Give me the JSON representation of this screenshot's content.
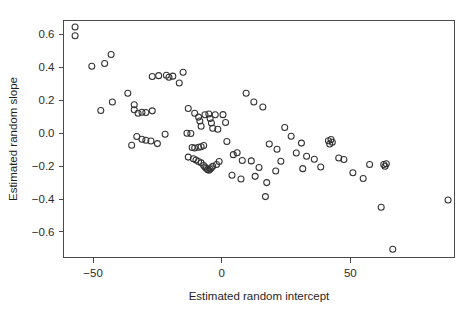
{
  "figure": {
    "width": 475,
    "height": 310,
    "background": "#ffffff",
    "point_color": "#333333",
    "axis_color": "#4a4a4a"
  },
  "chart_data": {
    "type": "scatter",
    "title": "",
    "xlabel": "Estimated random intercept",
    "ylabel": "Estimated random slope",
    "xlim": [
      -61.5,
      90.5
    ],
    "ylim": [
      -0.755,
      0.685
    ],
    "xticks": [
      -50,
      0,
      50
    ],
    "xticklabels": [
      "−50",
      "0",
      "50"
    ],
    "yticks": [
      -0.6,
      -0.4,
      -0.2,
      0.0,
      0.2,
      0.4,
      0.6
    ],
    "yticklabels": [
      "−0.6",
      "−0.4",
      "−0.2",
      "0.0",
      "0.2",
      "0.4",
      "0.6"
    ],
    "grid": false,
    "legend": null,
    "marker": "open-circle",
    "marker_size": 3.0,
    "n_points": 104,
    "points": [
      [
        -57.0,
        0.645
      ],
      [
        -57.0,
        0.592
      ],
      [
        -50.5,
        0.407
      ],
      [
        -45.5,
        0.424
      ],
      [
        -43.0,
        0.478
      ],
      [
        -47.0,
        0.138
      ],
      [
        -42.5,
        0.19
      ],
      [
        -36.5,
        0.243
      ],
      [
        -34.0,
        0.173
      ],
      [
        -34.0,
        0.143
      ],
      [
        -32.5,
        0.122
      ],
      [
        -31.0,
        0.127
      ],
      [
        -29.5,
        0.126
      ],
      [
        -27.0,
        0.136
      ],
      [
        -27.0,
        0.345
      ],
      [
        -24.5,
        0.35
      ],
      [
        -21.5,
        0.352
      ],
      [
        -20.5,
        0.34
      ],
      [
        -19.0,
        0.347
      ],
      [
        -15.0,
        0.37
      ],
      [
        -16.5,
        0.305
      ],
      [
        -35.0,
        -0.073
      ],
      [
        -33.0,
        -0.02
      ],
      [
        -31.0,
        -0.037
      ],
      [
        -29.5,
        -0.043
      ],
      [
        -27.5,
        -0.047
      ],
      [
        -25.0,
        -0.063
      ],
      [
        -22.0,
        -0.006
      ],
      [
        -13.0,
        0.15
      ],
      [
        -10.5,
        0.122
      ],
      [
        -9.0,
        0.098
      ],
      [
        -8.5,
        0.075
      ],
      [
        -8.0,
        0.042
      ],
      [
        -6.5,
        0.112
      ],
      [
        -5.0,
        0.117
      ],
      [
        -4.5,
        0.09
      ],
      [
        -4.0,
        0.062
      ],
      [
        -3.5,
        0.03
      ],
      [
        -2.5,
        0.112
      ],
      [
        -1.5,
        0.024
      ],
      [
        -13.5,
        0.0
      ],
      [
        -12.0,
        -0.002
      ],
      [
        -11.5,
        -0.087
      ],
      [
        -10.5,
        -0.09
      ],
      [
        -9.0,
        -0.085
      ],
      [
        -8.0,
        -0.082
      ],
      [
        -7.0,
        -0.075
      ],
      [
        -13.0,
        -0.145
      ],
      [
        -11.0,
        -0.155
      ],
      [
        -10.0,
        -0.162
      ],
      [
        -9.0,
        -0.172
      ],
      [
        -8.0,
        -0.18
      ],
      [
        -7.0,
        -0.196
      ],
      [
        -6.5,
        -0.205
      ],
      [
        -6.0,
        -0.213
      ],
      [
        -5.5,
        -0.22
      ],
      [
        -5.0,
        -0.225
      ],
      [
        -4.5,
        -0.218
      ],
      [
        -4.0,
        -0.21
      ],
      [
        -3.5,
        -0.2
      ],
      [
        -2.0,
        -0.19
      ],
      [
        -1.0,
        -0.172
      ],
      [
        0.5,
        0.113
      ],
      [
        1.5,
        0.065
      ],
      [
        2.0,
        -0.05
      ],
      [
        4.5,
        -0.13
      ],
      [
        6.0,
        -0.118
      ],
      [
        8.0,
        -0.165
      ],
      [
        4.0,
        -0.255
      ],
      [
        7.5,
        -0.278
      ],
      [
        11.5,
        -0.168
      ],
      [
        13.0,
        -0.262
      ],
      [
        14.5,
        -0.208
      ],
      [
        17.5,
        -0.3
      ],
      [
        9.5,
        0.243
      ],
      [
        12.5,
        0.19
      ],
      [
        16.0,
        0.16
      ],
      [
        18.5,
        -0.065
      ],
      [
        21.5,
        -0.097
      ],
      [
        23.0,
        -0.17
      ],
      [
        21.0,
        -0.23
      ],
      [
        17.0,
        -0.385
      ],
      [
        24.5,
        0.035
      ],
      [
        27.0,
        -0.018
      ],
      [
        29.0,
        -0.12
      ],
      [
        31.0,
        -0.06
      ],
      [
        33.0,
        -0.14
      ],
      [
        31.5,
        -0.215
      ],
      [
        36.0,
        -0.158
      ],
      [
        38.5,
        -0.205
      ],
      [
        41.5,
        -0.046
      ],
      [
        42.5,
        -0.038
      ],
      [
        43.0,
        -0.055
      ],
      [
        42.0,
        -0.065
      ],
      [
        45.5,
        -0.15
      ],
      [
        47.5,
        -0.16
      ],
      [
        51.0,
        -0.24
      ],
      [
        55.0,
        -0.275
      ],
      [
        57.5,
        -0.19
      ],
      [
        63.0,
        -0.19
      ],
      [
        63.5,
        -0.2
      ],
      [
        64.0,
        -0.185
      ],
      [
        62.0,
        -0.45
      ],
      [
        66.5,
        -0.705
      ],
      [
        88.0,
        -0.405
      ]
    ]
  }
}
